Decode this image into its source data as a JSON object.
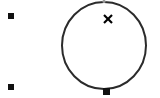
{
  "canvas": {
    "width": 160,
    "height": 98,
    "background_color": "#ffffff",
    "label": "drawing-canvas"
  },
  "palette": {
    "shape_stroke": "#2b2b2b",
    "handle_fill": "#111111",
    "marker_fill": "#000000",
    "anchor_dot": "#9a9a9a"
  },
  "shapes": [
    {
      "name": "circle",
      "type": "ellipse",
      "cx": 104,
      "cy": 45.5,
      "rx": 42,
      "ry": 43.5,
      "stroke_color": "#2b2b2b",
      "stroke_width": 2,
      "fill": "none"
    }
  ],
  "handles": [
    {
      "name": "handle-top-left",
      "x": 8,
      "y": 13,
      "size": 6,
      "color": "#111111"
    },
    {
      "name": "handle-bottom-left",
      "x": 8,
      "y": 84,
      "size": 6,
      "color": "#111111"
    },
    {
      "name": "handle-circle-bottom",
      "x": 103,
      "y": 88,
      "size": 7,
      "color": "#111111"
    }
  ],
  "markers": [
    {
      "name": "cursor-x-marker",
      "glyph": "x",
      "x": 108,
      "y": 19,
      "size": 8,
      "color": "#000000"
    },
    {
      "name": "anchor-point-top",
      "x": 104,
      "y": 1.5,
      "radius": 1.6,
      "color": "#9a9a9a"
    }
  ],
  "accessibility": {
    "canvas_description": "White canvas with a circle outline, three square selection handles and an x cursor marker"
  }
}
